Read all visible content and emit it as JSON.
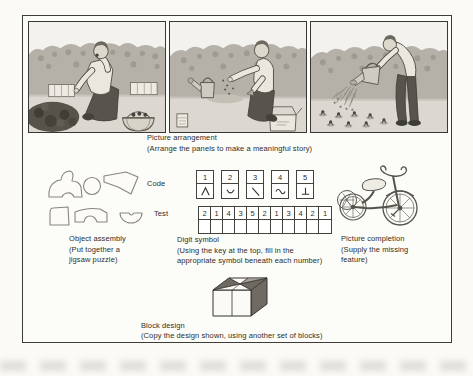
{
  "figure": {
    "picture_arrangement": {
      "title": "Picture arrangement",
      "subtitle": "(Arrange the panels to make a meaningful story)",
      "panels": [
        {
          "alt": "Man kneeling in a garden patch tasting a berry, baskets nearby"
        },
        {
          "alt": "Man kneeling, sowing seeds with a trowel; watering can and seed box nearby"
        },
        {
          "alt": "Man standing bent over, watering rows of seedlings with a watering can"
        }
      ]
    },
    "object_assembly": {
      "title": "Object assembly",
      "subtitle_line1": "(Put together a",
      "subtitle_line2": "jigsaw puzzle)"
    },
    "digit_symbol": {
      "title": "Digit symbol",
      "subtitle_line1": "(Using the key at the top, fill in the",
      "subtitle_line2": "appropriate symbol beneath each number)",
      "code_label": "Code",
      "test_label": "Test",
      "code_key": [
        {
          "number": "1",
          "symbol": "caret"
        },
        {
          "number": "2",
          "symbol": "shallow-curve"
        },
        {
          "number": "3",
          "symbol": "backslash"
        },
        {
          "number": "4",
          "symbol": "wave"
        },
        {
          "number": "5",
          "symbol": "inverted-tee"
        }
      ],
      "test_numbers": [
        "2",
        "1",
        "4",
        "3",
        "5",
        "2",
        "1",
        "3",
        "4",
        "2",
        "1"
      ]
    },
    "picture_completion": {
      "title": "Picture completion",
      "subtitle_line1": "(Supply the missing",
      "subtitle_line2": "feature)"
    },
    "block_design": {
      "title": "Block design",
      "subtitle": "(Copy the design shown, using another set of blocks)"
    }
  },
  "colors": {
    "ink": "#2f2d29",
    "line_art": "#56534b",
    "paper": "#fbfaf7",
    "dark_fill": "#6e6a62"
  }
}
